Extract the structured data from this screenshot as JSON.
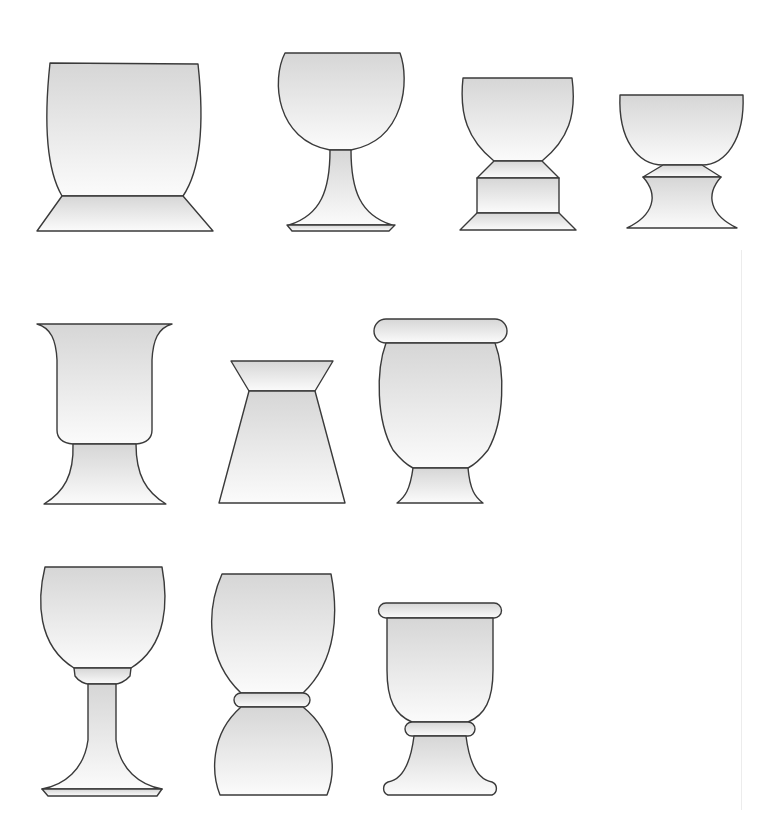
{
  "figure": {
    "colors": {
      "outline": "#3a3a3a",
      "fill_top": "#d6d6d6",
      "fill_bottom": "#fbfbfb",
      "background": "#ffffff"
    },
    "rows": [
      {
        "row": 1,
        "vessels": [
          {
            "id": "v1",
            "type": "tumbler-vase-on-trapezoid-base",
            "paths": [
              "M50,63 L198,64 C203,110 204,165 183,196 L62,196 C44,165 45,110 50,63 Z",
              "M62,196 L183,196 L213,231 L37,231 Z"
            ]
          },
          {
            "id": "v2",
            "type": "wine-goblet",
            "paths": [
              "M285,53 L400,53 C410,80 405,140 351,150 L330,150 C276,140 271,80 285,53 Z",
              "M330,150 L351,150 C351,190 360,215 392,225 L289,225 C321,215 330,190 330,150 Z",
              "M287,225 L395,225 L389,231 L292,231 Z"
            ]
          },
          {
            "id": "v3",
            "type": "cup-on-stepped-pedestal",
            "paths": [
              "M463,78 L572,78 C577,115 568,140 542,161 L494,161 C468,140 459,115 463,78 Z",
              "M494,161 L542,161 L559,178 L477,178 Z",
              "M477,178 L559,178 L559,213 L477,213 Z",
              "M477,213 L559,213 L576,230 L460,230 Z"
            ]
          },
          {
            "id": "v4",
            "type": "bowl-on-spool-foot",
            "paths": [
              "M620,95 L743,95 C745,140 725,165 702,165 L663,165 C638,165 618,140 620,95 Z",
              "M663,165 L702,165 L721,177 L643,177 Z",
              "M643,177 L721,177 C705,195 710,215 737,228 L627,228 C654,215 659,195 643,177 Z"
            ]
          }
        ]
      },
      {
        "row": 2,
        "vessels": [
          {
            "id": "v5",
            "type": "trumpet-vase",
            "paths": [
              "M37,324 L172,324 C158,328 153,340 152,360 L152,430 C152,438 147,443 136,444 L73,444 C62,443 57,438 57,430 L57,360 C56,340 51,328 37,324 Z",
              "M73,444 L136,444 C136,475 146,492 166,504 L44,504 C64,492 74,475 73,444 Z"
            ]
          },
          {
            "id": "v6",
            "type": "hourglass-trapezoid-vase",
            "paths": [
              "M231,361 L333,361 L315,391 L249,391 Z",
              "M249,391 L315,391 L345,503 L219,503 Z"
            ]
          },
          {
            "id": "v7",
            "type": "urn-with-rolled-rim",
            "paths": [
              "M386,319 L495,319 A12,12 0 0 1 495,343 L386,343 A12,12 0 0 1 386,343 A12,12 0 0 1 386,319 Z",
              "M386,343 L495,343 C505,370 505,420 488,450 C480,460 472,466 468,468 L413,468 C409,466 401,460 393,450 C376,420 376,370 386,343 Z",
              "M413,468 L468,468 C470,490 475,497 483,503 L397,503 C405,497 410,490 413,468 Z"
            ]
          }
        ]
      },
      {
        "row": 3,
        "vessels": [
          {
            "id": "v8",
            "type": "chalice-with-knop-and-flared-foot",
            "paths": [
              "M45,567 L162,567 C168,600 168,645 131,668 L74,668 C37,645 37,600 45,567 Z",
              "M74,668 L131,668 L130,676 C125,682 118,684 116,684 L88,684 C86,684 79,682 75,676 Z",
              "M88,684 L116,684 L116,740 C120,770 140,785 162,789 L42,789 C64,785 84,770 88,740 Z",
              "M42,789 L162,789 L157,796 L48,796 Z"
            ]
          },
          {
            "id": "v9",
            "type": "double-bulb-vase",
            "paths": [
              "M222,574 L331,574 C338,610 338,660 303,693 L241,693 C206,660 206,610 222,574 Z",
              "M241,693 L303,693 A7,7 0 0 1 303,707 L241,707 A7,7 0 0 1 241,693 Z",
              "M241,707 L303,707 C338,735 335,775 327,795 L220,795 C212,775 209,735 241,707 Z"
            ]
          },
          {
            "id": "v10",
            "type": "cup-with-rolled-rim-and-bell-foot",
            "paths": [
              "M386,603 L494,603 A7.5,7.5 0 0 1 494,618 L386,618 A7.5,7.5 0 0 1 386,603 Z",
              "M387,618 L493,618 L493,670 C493,700 485,715 468,722 L412,722 C395,715 387,700 387,670 Z",
              "M412,722 L468,722 A7,7 0 0 1 468,736 L412,736 A7,7 0 0 1 412,722 Z",
              "M414,736 L466,736 C470,768 480,780 492,782 A7,7 0 0 1 492,795 L388,795 A7,7 0 0 1 388,782 C400,780 410,768 414,736 Z"
            ]
          }
        ]
      }
    ]
  }
}
